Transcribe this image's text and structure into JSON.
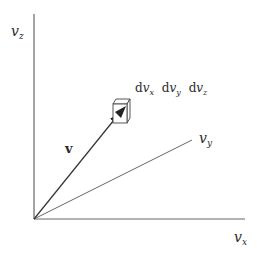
{
  "diagram": {
    "axes": {
      "vertical": {
        "symbol": "v",
        "subscript": "z"
      },
      "horizontal": {
        "symbol": "v",
        "subscript": "x"
      },
      "oblique": {
        "symbol": "v",
        "subscript": "y"
      }
    },
    "vector_label": "v",
    "volume_element": [
      {
        "prefix": "d",
        "symbol": "v",
        "subscript": "x"
      },
      {
        "prefix": "d",
        "symbol": "v",
        "subscript": "y"
      },
      {
        "prefix": "d",
        "symbol": "v",
        "subscript": "z"
      }
    ],
    "colors": {
      "line": "#555555",
      "text": "#2a2a2a",
      "cube_face": "#ffffff"
    }
  }
}
